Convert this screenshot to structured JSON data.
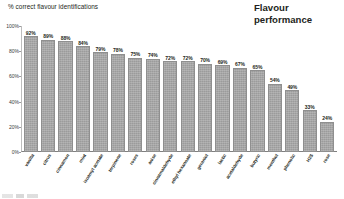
{
  "header": {
    "axis_title": "% correct flavour identifications",
    "panel_title_line1": "Flavour",
    "panel_title_line2": "performance"
  },
  "chart_data": {
    "type": "bar",
    "title": "Flavour performance",
    "xlabel": "",
    "ylabel": "% correct flavour identifications",
    "ylim": [
      0,
      100
    ],
    "ytick_labels": [
      "100%",
      "80%",
      "60%",
      "40%",
      "20%",
      "0%"
    ],
    "ytick_values": [
      100,
      80,
      60,
      40,
      20,
      0
    ],
    "grid": false,
    "legend": "none",
    "bar_color": "#a6a6a6",
    "categories": [
      "vanilla",
      "citrus",
      "cinnamon",
      "mint",
      "isoamyl acetate",
      "terpinene",
      "roses",
      "anise",
      "cinnamaldehyde",
      "ethyl hexanoate",
      "geraniol",
      "lactic",
      "acetaldehyde",
      "butyric",
      "menthol",
      "phenolic",
      "H2S",
      "rose"
    ],
    "values": [
      92,
      89,
      88,
      84,
      79,
      78,
      75,
      74,
      72,
      72,
      70,
      69,
      67,
      65,
      54,
      49,
      33,
      24
    ],
    "value_labels": [
      "92%",
      "89%",
      "88%",
      "84%",
      "79%",
      "78%",
      "75%",
      "74%",
      "72%",
      "72%",
      "70%",
      "69%",
      "67%",
      "65%",
      "54%",
      "49%",
      "33%",
      "24%"
    ]
  }
}
